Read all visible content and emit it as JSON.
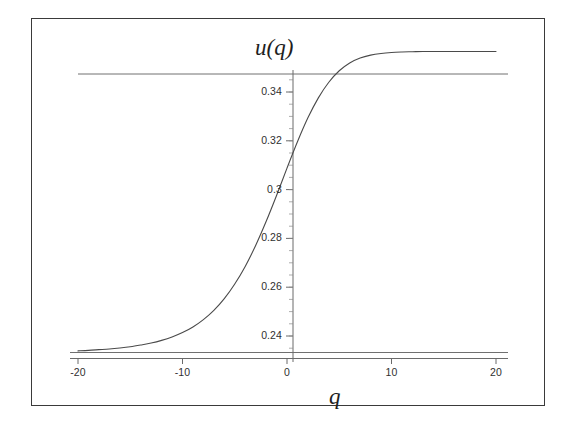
{
  "chart_data": {
    "type": "line",
    "title": "",
    "xlabel": "q",
    "ylabel": "u(q)",
    "xlim": [
      -20,
      20
    ],
    "ylim": [
      0.2305,
      0.3495
    ],
    "grid": false,
    "legend": null,
    "xticks": [
      -20,
      -10,
      0,
      10,
      20
    ],
    "xticklabels": [
      "-20",
      "-10",
      "0",
      "10",
      "20"
    ],
    "yticks": [
      0.34,
      0.32,
      0.3,
      0.28,
      0.26,
      0.24
    ],
    "yticklabels": [
      "0.34",
      "0.32",
      "0.3",
      "0.28",
      "0.26",
      "0.24"
    ],
    "annotations": [
      {
        "name": "upper-asymptote",
        "type": "hline",
        "y": 0.3473
      },
      {
        "name": "lower-asymptote",
        "type": "hline",
        "y": 0.2335
      },
      {
        "name": "x-axis-line",
        "type": "hline",
        "y": 0.2311
      },
      {
        "name": "y-axis-line",
        "type": "vline",
        "x": 0.0
      }
    ],
    "series": [
      {
        "name": "u(q)",
        "color": "#4a4a4a",
        "linewidth": 1.1,
        "x": [
          -20,
          -19,
          -18,
          -17,
          -16,
          -15,
          -14,
          -13,
          -12,
          -11,
          -10,
          -9,
          -8,
          -7,
          -6,
          -5,
          -4,
          -3,
          -2,
          -1,
          0,
          1,
          2,
          3,
          4,
          5,
          6,
          7,
          8,
          9,
          10,
          11,
          12,
          13,
          14,
          15,
          16,
          17,
          18,
          19,
          20
        ],
        "y": [
          0.2339,
          0.2341,
          0.2344,
          0.2347,
          0.2351,
          0.2356,
          0.2363,
          0.2371,
          0.2382,
          0.2396,
          0.2414,
          0.2437,
          0.2467,
          0.2505,
          0.2553,
          0.2613,
          0.2685,
          0.2771,
          0.2869,
          0.2976,
          0.3088,
          0.3196,
          0.3294,
          0.3376,
          0.344,
          0.3487,
          0.3519,
          0.3539,
          0.3551,
          0.3558,
          0.3562,
          0.3564,
          0.3565,
          0.3566,
          0.3566,
          0.3566,
          0.3566,
          0.3566,
          0.3566,
          0.3566,
          0.3566
        ]
      }
    ]
  },
  "figure": {
    "background": "#ffffff",
    "frame_color": "#3a3a3a",
    "curve_color": "#4a4a4a",
    "axis_color": "#6a6a6a"
  }
}
